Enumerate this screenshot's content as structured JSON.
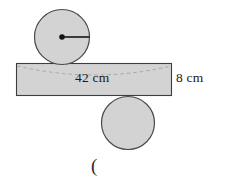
{
  "figure": {
    "type": "geometry-diagram",
    "canvas": {
      "width": 236,
      "height": 186,
      "background": "#ffffff"
    },
    "colors": {
      "shape_fill": "#d3d3d3",
      "shape_stroke": "#4a4a4a",
      "rect_stroke": "#3d3d3d",
      "dashed_arc": "#9a9a9a",
      "radius_line": "#2b2b2b",
      "text": "#1a1a1a"
    },
    "shapes": {
      "top_circle": {
        "name": "top-circle",
        "cx": 62,
        "cy": 37,
        "r": 28,
        "has_center_dot": true,
        "has_radius_line": true,
        "radius_line_to": {
          "x": 90,
          "y": 37
        }
      },
      "bottom_circle": {
        "name": "bottom-circle",
        "cx": 128,
        "cy": 123,
        "r": 27
      },
      "rectangle": {
        "name": "body-rectangle",
        "x": 16,
        "y": 63,
        "width": 156,
        "height": 33
      },
      "dashed_arc": {
        "name": "dashed-ellipse-arc",
        "start": {
          "x": 17,
          "y": 66
        },
        "control": {
          "x": 95,
          "y": 84
        },
        "end": {
          "x": 171,
          "y": 66
        }
      }
    },
    "labels": {
      "width_label": "42 cm",
      "height_label": "8 cm",
      "footer_mark": "("
    }
  }
}
